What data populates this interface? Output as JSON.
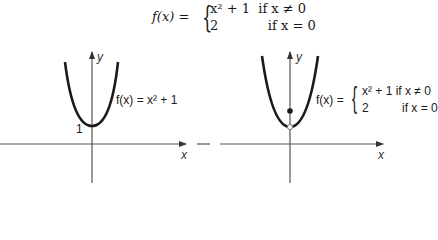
{
  "formula": {
    "lhs": "f(x) =",
    "case1": "x² + 1  if x ≠ 0",
    "case2": "2            if x = 0"
  },
  "left_graph": {
    "label": "f(x) = x² + 1",
    "intercept_label": "1",
    "x_axis_label": "x",
    "y_axis_label": "y"
  },
  "right_graph": {
    "label_lhs": "f(x) =",
    "case1": "x² + 1 if x ≠ 0",
    "case2": "2          if x = 0",
    "x_axis_label": "x",
    "y_axis_label": "y",
    "filled_point": "(0, 2)",
    "open_point": "(0, 1)"
  }
}
